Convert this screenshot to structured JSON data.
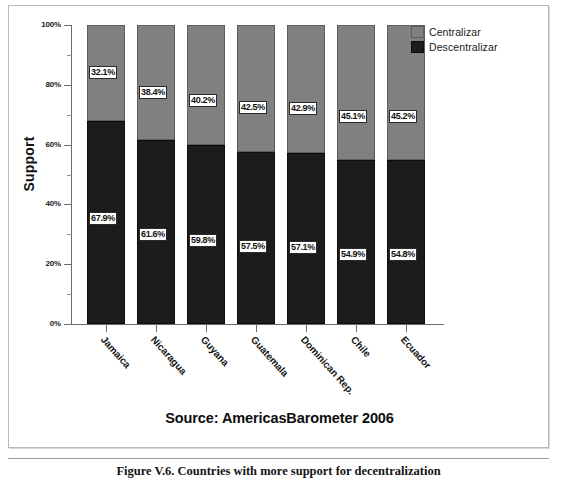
{
  "figure": {
    "caption": "Figure V.6. Countries with more support for decentralization",
    "source_note": "Source: AmericasBarometer 2006"
  },
  "legend": {
    "position": "top-right",
    "items": [
      {
        "label": "Centralizar",
        "color": "#808080",
        "swatch": "centralizar"
      },
      {
        "label": "Descentralizar",
        "color": "#1c1c1c",
        "swatch": "descentralizar"
      }
    ]
  },
  "axes": {
    "y_title": "Support",
    "y_ticks": [
      "0%",
      "20%",
      "40%",
      "60%",
      "80%",
      "100%"
    ],
    "y_tick_values": [
      0,
      20,
      40,
      60,
      80,
      100
    ],
    "y_minor_values": [
      10,
      30,
      50,
      70,
      90
    ]
  },
  "chart_data": {
    "type": "bar",
    "subtype": "stacked-100-percent",
    "title": "",
    "subtitle": "",
    "xlabel": "",
    "ylabel": "Support",
    "ylim": [
      0,
      100
    ],
    "grid": false,
    "legend_position": "top-right",
    "categories": [
      "Jamaica",
      "Nicaragua",
      "Guyana",
      "Guatemala",
      "Dominican Rep.",
      "Chile",
      "Ecuador"
    ],
    "series": [
      {
        "name": "Descentralizar",
        "color": "#1c1c1c",
        "values": [
          67.9,
          61.6,
          59.8,
          57.5,
          57.1,
          54.9,
          54.8
        ],
        "labels": [
          "67.9%",
          "61.6%",
          "59.8%",
          "57.5%",
          "57.1%",
          "54.9%",
          "54.8%"
        ]
      },
      {
        "name": "Centralizar",
        "color": "#808080",
        "values": [
          32.1,
          38.4,
          40.2,
          42.5,
          42.9,
          45.1,
          45.2
        ],
        "labels": [
          "32.1%",
          "38.4%",
          "40.2%",
          "42.5%",
          "42.9%",
          "45.1%",
          "45.2%"
        ]
      }
    ]
  }
}
